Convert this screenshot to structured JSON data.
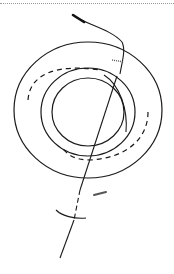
{
  "diagram": {
    "type": "technical line drawing",
    "stroke_color": "#1a1a1a",
    "dash_color": "#1a1a1a",
    "hatch_color": "#555555",
    "border_color": "#9a9a9a",
    "elements": {
      "outer_circle": {
        "cx": 88,
        "cy": 110,
        "r": 76
      },
      "dashed_circle": {
        "cx": 88,
        "cy": 110,
        "r": 60
      },
      "middle_circle": {
        "cx": 92,
        "cy": 106,
        "r": 46
      },
      "inner_circle": {
        "cx": 92,
        "cy": 104,
        "r": 37
      }
    }
  }
}
